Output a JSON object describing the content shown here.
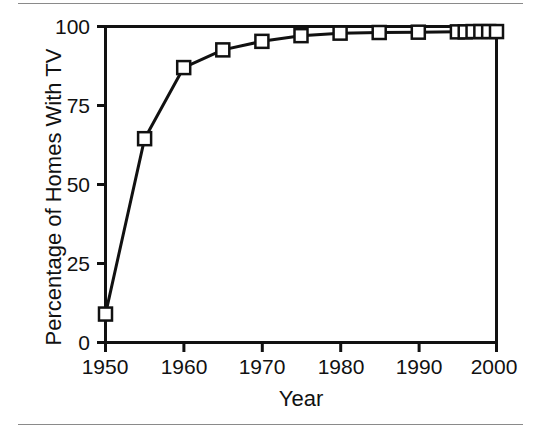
{
  "chart_data": {
    "type": "line",
    "title": "",
    "xlabel": "Year",
    "ylabel": "Percentage of Homes With TV",
    "xlim": [
      1950,
      2000
    ],
    "ylim": [
      0,
      100
    ],
    "grid": false,
    "legend": "none",
    "marker": "open-square",
    "xticks": [
      1950,
      1960,
      1970,
      1980,
      1990,
      2000
    ],
    "xtick_labels": [
      "1950",
      "1960",
      "1970",
      "1980",
      "1990",
      "2000"
    ],
    "yticks": [
      0,
      25,
      50,
      75,
      100
    ],
    "ytick_labels": [
      "0",
      "25",
      "50",
      "75",
      "100"
    ],
    "x": [
      1950,
      1955,
      1960,
      1965,
      1970,
      1975,
      1980,
      1985,
      1990,
      1995,
      1996,
      1997,
      1998,
      1999,
      2000
    ],
    "values": [
      9,
      64.5,
      87,
      92.6,
      95.3,
      97.1,
      97.9,
      98.1,
      98.2,
      98.3,
      98.3,
      98.4,
      98.4,
      98.4,
      98.4
    ],
    "series": [
      {
        "name": "Percentage of Homes With TV",
        "x": [
          1950,
          1955,
          1960,
          1965,
          1970,
          1975,
          1980,
          1985,
          1990,
          1995,
          1996,
          1997,
          1998,
          1999,
          2000
        ],
        "values": [
          9,
          64.5,
          87,
          92.6,
          95.3,
          97.1,
          97.9,
          98.1,
          98.2,
          98.3,
          98.3,
          98.4,
          98.4,
          98.4,
          98.4
        ]
      }
    ]
  },
  "style": {
    "line_color": "#111111",
    "marker_fill": "#ffffff",
    "marker_stroke": "#111111",
    "axis_color": "#111111",
    "rule_color": "#8a8a8a"
  }
}
